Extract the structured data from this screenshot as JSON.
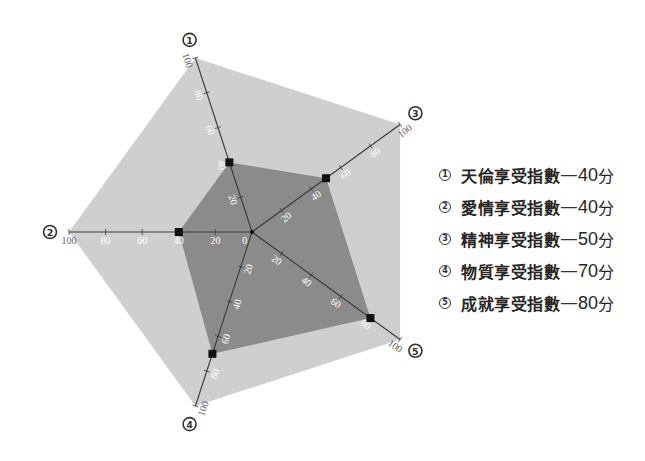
{
  "legend": {
    "items": [
      {
        "num": "1",
        "name": "天倫享受指數",
        "separator": "—",
        "score": "40",
        "unit": "分"
      },
      {
        "num": "2",
        "name": "愛情享受指數",
        "separator": "—",
        "score": "40",
        "unit": "分"
      },
      {
        "num": "3",
        "name": "精神享受指數",
        "separator": "—",
        "score": "50",
        "unit": "分"
      },
      {
        "num": "4",
        "name": "物質享受指數",
        "separator": "—",
        "score": "70",
        "unit": "分"
      },
      {
        "num": "5",
        "name": "成就享受指數",
        "separator": "—",
        "score": "80",
        "unit": "分"
      }
    ]
  },
  "chart_data": {
    "type": "radar",
    "title": "",
    "categories": [
      "天倫享受指數",
      "愛情享受指數",
      "精神享受指數",
      "物質享受指數",
      "成就享受指數"
    ],
    "axis_markers": [
      "1",
      "2",
      "3",
      "4",
      "5"
    ],
    "values": [
      40,
      40,
      50,
      70,
      80
    ],
    "unit": "分",
    "range": [
      0,
      100
    ],
    "ticks": [
      20,
      40,
      60,
      80,
      100
    ],
    "tick_labels": [
      [
        20,
        40,
        60,
        80,
        100
      ],
      [
        0,
        20,
        40,
        60,
        80,
        100
      ],
      [
        20,
        40,
        60,
        80,
        100
      ],
      [
        20,
        40,
        60,
        80,
        100
      ],
      [
        20,
        40,
        60,
        80,
        100
      ]
    ],
    "axis_angles_deg": [
      108,
      180,
      36,
      -108,
      -36
    ],
    "grid": false,
    "legend_position": "right",
    "colors": {
      "background": "#cfcfcf",
      "data_area": "#8b8b8b",
      "axis": "#3a3a3a",
      "marker": "#111111",
      "tick_label": "#ffffff",
      "max_label": "#666666",
      "badge": "#333333"
    },
    "layout": {
      "center": [
        252,
        232
      ],
      "radius": 183,
      "badge_radius": 202
    }
  }
}
